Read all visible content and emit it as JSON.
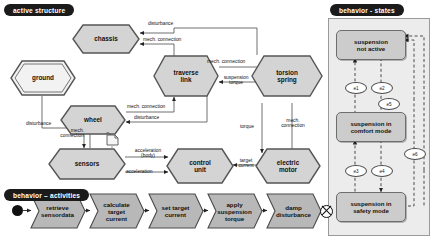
{
  "sections": {
    "active_structure": "active structure",
    "behavior_activities": "behavior – activities",
    "behavior_states": "behavior - states"
  },
  "colors": {
    "node_fill": "#d4d4d4",
    "node_stroke": "#555555",
    "ground_fill": "#f2f2f2",
    "activity_fill": "#b8b8b8",
    "state_fill": "#cccccc",
    "panel_bg": "#ececec",
    "label_bg": "#1b1b1b",
    "label_fg": "#ffffff",
    "page_bg": "#ffffff"
  },
  "active_structure": {
    "nodes": [
      {
        "id": "chassis",
        "label": "chassis",
        "shape": "hexagon"
      },
      {
        "id": "ground",
        "label": "ground",
        "shape": "hexagon-double"
      },
      {
        "id": "wheel",
        "label": "wheel",
        "shape": "hexagon"
      },
      {
        "id": "traverse_link",
        "label": "traverse link",
        "line1": "traverse",
        "line2": "link",
        "shape": "hexagon"
      },
      {
        "id": "torsion_spring",
        "label": "torsion spring",
        "line1": "torsion",
        "line2": "spring",
        "shape": "hexagon"
      },
      {
        "id": "sensors",
        "label": "sensors",
        "shape": "hexagon"
      },
      {
        "id": "control_unit",
        "label": "control unit",
        "line1": "control",
        "line2": "unit",
        "shape": "hexagon"
      },
      {
        "id": "electric_motor",
        "label": "electric motor",
        "line1": "electric",
        "line2": "motor",
        "shape": "hexagon"
      }
    ],
    "edge_labels": [
      {
        "id": "e-disturbance-chassis",
        "text": "disturbance"
      },
      {
        "id": "e-mech-chassis",
        "text": "mech. connection"
      },
      {
        "id": "e-disturbance-ground-wheel",
        "text": "disturbance"
      },
      {
        "id": "e-mech-wheel-traverse",
        "text": "mech. connection"
      },
      {
        "id": "e-disturbance-wheel",
        "text": "disturbance"
      },
      {
        "id": "e-mech-traverse-torsion",
        "text": "mech. connection"
      },
      {
        "id": "e-suspension-torque",
        "line1": "suspension",
        "line2": "torque"
      },
      {
        "id": "e-mech-traverse-right",
        "line1": "mech.",
        "line2": "connection"
      },
      {
        "id": "e-suspension-torque-right",
        "line1": "suspension",
        "line2": "torque"
      },
      {
        "id": "e-torque",
        "text": "torque"
      },
      {
        "id": "e-mech-motor",
        "line1": "mech.",
        "line2": "connection"
      },
      {
        "id": "e-mech-wheel-sensors",
        "line1": "mech.",
        "line2": "connection"
      },
      {
        "id": "e-acceleration-body",
        "line1": "acceleration",
        "line2": "(body)"
      },
      {
        "id": "e-acceleration",
        "text": "acceleration"
      },
      {
        "id": "e-target-current",
        "line1": "target",
        "line2": "current"
      }
    ]
  },
  "activities": {
    "initial_node": "initial-node",
    "final_node": "final-node",
    "steps": [
      {
        "id": "a1",
        "line1": "retrieve",
        "line2": "sensordata",
        "line3": ""
      },
      {
        "id": "a2",
        "line1": "calculate",
        "line2": "target",
        "line3": "current"
      },
      {
        "id": "a3",
        "line1": "set target",
        "line2": "current",
        "line3": ""
      },
      {
        "id": "a4",
        "line1": "apply",
        "line2": "suspension",
        "line3": "torque"
      },
      {
        "id": "a5",
        "line1": "damp",
        "line2": "disturbance",
        "line3": ""
      }
    ]
  },
  "states": {
    "items": [
      {
        "id": "s1",
        "line1": "suspension",
        "line2": "not active"
      },
      {
        "id": "s2",
        "line1": "suspension in",
        "line2": "comfort mode"
      },
      {
        "id": "s3",
        "line1": "suspension in",
        "line2": "safety mode"
      }
    ],
    "events": [
      {
        "id": "ev1",
        "label": "e1"
      },
      {
        "id": "ev2",
        "label": "e2"
      },
      {
        "id": "ev5",
        "label": "e5"
      },
      {
        "id": "ev3",
        "label": "e3"
      },
      {
        "id": "ev4",
        "label": "e4"
      },
      {
        "id": "ev6",
        "label": "e6"
      }
    ]
  }
}
